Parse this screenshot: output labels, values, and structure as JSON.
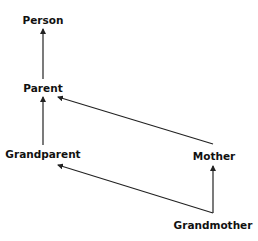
{
  "diagram": {
    "type": "class-hierarchy",
    "colors": {
      "edge": "#222222",
      "text": "#111111",
      "background": "#ffffff"
    },
    "nodes": [
      {
        "id": "person",
        "label": "Person",
        "x": 43,
        "y": 20
      },
      {
        "id": "parent",
        "label": "Parent",
        "x": 43,
        "y": 88
      },
      {
        "id": "grandparent",
        "label": "Grandparent",
        "x": 43,
        "y": 154
      },
      {
        "id": "mother",
        "label": "Mother",
        "x": 214,
        "y": 156
      },
      {
        "id": "grandmother",
        "label": "Grandmother",
        "x": 213,
        "y": 225
      }
    ],
    "edges": [
      {
        "from": "parent",
        "to": "person",
        "x1": 43,
        "y1": 79,
        "x2": 43,
        "y2": 29
      },
      {
        "from": "grandparent",
        "to": "parent",
        "x1": 43,
        "y1": 145,
        "x2": 43,
        "y2": 97
      },
      {
        "from": "mother",
        "to": "parent",
        "x1": 213,
        "y1": 144,
        "x2": 58,
        "y2": 97
      },
      {
        "from": "grandmother",
        "to": "mother",
        "x1": 213,
        "y1": 213,
        "x2": 213,
        "y2": 166
      },
      {
        "from": "grandmother",
        "to": "grandparent",
        "x1": 213,
        "y1": 213,
        "x2": 58,
        "y2": 165
      }
    ]
  }
}
